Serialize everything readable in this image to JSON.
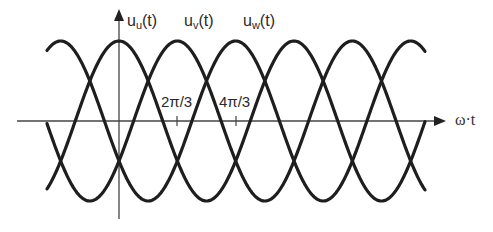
{
  "diagram": {
    "x_axis_label": "ω·t",
    "series": [
      {
        "name": "u_u(t)",
        "base": "u",
        "sub": "u",
        "suffix": "(t)",
        "phase_shift": "0"
      },
      {
        "name": "u_v(t)",
        "base": "u",
        "sub": "v",
        "suffix": "(t)",
        "phase_shift": "2π/3"
      },
      {
        "name": "u_w(t)",
        "base": "u",
        "sub": "w",
        "suffix": "(t)",
        "phase_shift": "4π/3"
      }
    ],
    "ticks": [
      {
        "label": "2π/3"
      },
      {
        "label": "4π/3"
      }
    ],
    "colors": {
      "curve": "#1e1e1e",
      "axis": "#444444",
      "text": "#2a2a2a"
    }
  }
}
